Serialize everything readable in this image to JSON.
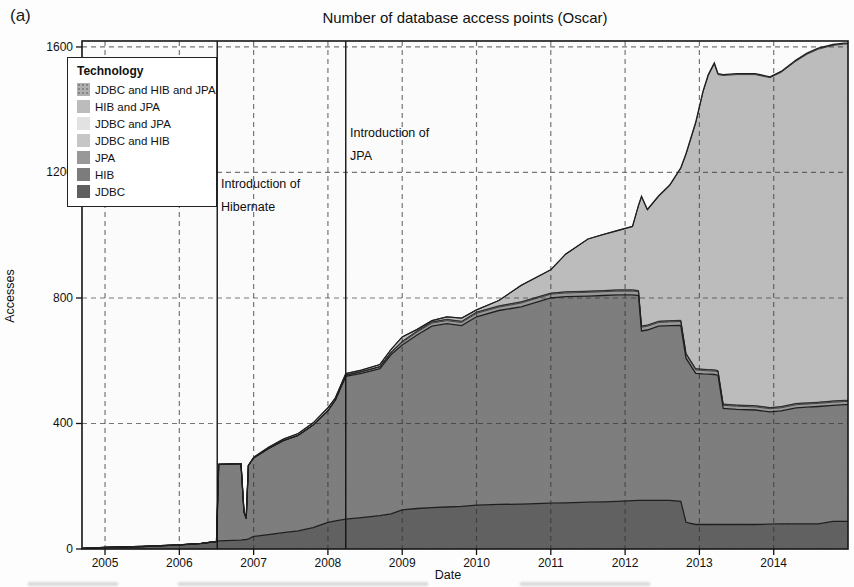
{
  "figure_label": "(a)",
  "title": "Number of database access points (Oscar)",
  "axes": {
    "x_label": "Date",
    "y_label": "Accesses"
  },
  "legend": {
    "title": "Technology",
    "entries": [
      {
        "label": "JDBC and HIB and JPA",
        "color": "#b0b0b0",
        "dotted": true
      },
      {
        "label": "HIB and JPA",
        "color": "#bcbcbc",
        "dotted": false
      },
      {
        "label": "JDBC and JPA",
        "color": "#e2e2e2",
        "dotted": false
      },
      {
        "label": "JDBC and HIB",
        "color": "#c6c6c6",
        "dotted": false
      },
      {
        "label": "JPA",
        "color": "#989898",
        "dotted": false
      },
      {
        "label": "HIB",
        "color": "#7c7c7c",
        "dotted": false
      },
      {
        "label": "JDBC",
        "color": "#5f5f5f",
        "dotted": false
      }
    ]
  },
  "annotations": [
    {
      "line1": "Introduction of",
      "line2": "Hibernate",
      "year": 2006.51
    },
    {
      "line1": "Introduction of",
      "line2": "JPA",
      "year": 2008.24
    }
  ],
  "chart_data": {
    "type": "area",
    "stacked": true,
    "title": "Number of database access points (Oscar)",
    "xlabel": "Date",
    "ylabel": "Accesses",
    "x_range": [
      2004.69,
      2015.0
    ],
    "y_range": [
      0,
      1619
    ],
    "x_ticks": [
      2005,
      2006,
      2007,
      2008,
      2009,
      2010,
      2011,
      2012,
      2013,
      2014
    ],
    "y_ticks": [
      0,
      400,
      800,
      1200,
      1600
    ],
    "grid": true,
    "legend_position": "top-left",
    "event_lines": [
      2006.51,
      2008.24
    ],
    "x": [
      2004.69,
      2005.0,
      2005.5,
      2006.0,
      2006.3,
      2006.5,
      2006.53,
      2006.83,
      2006.87,
      2006.9,
      2006.93,
      2007.0,
      2007.2,
      2007.4,
      2007.6,
      2007.8,
      2008.0,
      2008.1,
      2008.24,
      2008.45,
      2008.7,
      2008.85,
      2009.0,
      2009.2,
      2009.4,
      2009.6,
      2009.8,
      2010.0,
      2010.3,
      2010.6,
      2011.0,
      2011.2,
      2011.5,
      2011.7,
      2011.9,
      2012.1,
      2012.18,
      2012.22,
      2012.3,
      2012.45,
      2012.6,
      2012.75,
      2012.82,
      2012.95,
      2013.05,
      2013.12,
      2013.2,
      2013.25,
      2013.32,
      2013.5,
      2013.75,
      2013.95,
      2014.1,
      2014.3,
      2014.45,
      2014.6,
      2014.8,
      2014.95,
      2015.0
    ],
    "series": [
      {
        "name": "JDBC",
        "color": "#5f5f5f",
        "values": [
          2,
          5,
          8,
          13,
          18,
          24,
          26,
          28,
          30,
          30,
          32,
          40,
          46,
          52,
          58,
          68,
          85,
          90,
          95,
          100,
          106,
          112,
          125,
          129,
          132,
          134,
          136,
          140,
          142,
          143,
          146,
          147,
          149,
          150,
          152,
          154,
          155,
          155,
          155,
          155,
          155,
          152,
          85,
          78,
          78,
          78,
          78,
          78,
          78,
          78,
          78,
          79,
          80,
          80,
          80,
          80,
          88,
          88,
          88
        ]
      },
      {
        "name": "HIB",
        "color": "#7c7c7c",
        "values": [
          0,
          0,
          0,
          0,
          0,
          0,
          244,
          244,
          88,
          68,
          234,
          250,
          274,
          293,
          304,
          327,
          355,
          385,
          455,
          460,
          469,
          508,
          525,
          553,
          578,
          584,
          576,
          600,
          618,
          629,
          654,
          657,
          657,
          658,
          658,
          656,
          653,
          540,
          543,
          555,
          557,
          561,
          523,
          482,
          480,
          479,
          478,
          476,
          370,
          367,
          365,
          358,
          360,
          370,
          372,
          374,
          370,
          372,
          372
        ]
      },
      {
        "name": "JPA",
        "color": "#989898",
        "values": [
          0,
          0,
          0,
          0,
          0,
          0,
          0,
          0,
          0,
          0,
          0,
          0,
          0,
          0,
          0,
          0,
          0,
          0,
          4,
          5,
          6,
          7,
          8,
          9,
          10,
          10,
          10,
          11,
          11,
          12,
          12,
          12,
          12,
          12,
          12,
          12,
          12,
          12,
          12,
          12,
          12,
          12,
          12,
          11,
          11,
          11,
          11,
          11,
          10,
          10,
          10,
          10,
          10,
          10,
          10,
          10,
          10,
          10,
          10
        ]
      },
      {
        "name": "JDBC and HIB",
        "color": "#c6c6c6",
        "values": [
          0,
          0,
          0,
          0,
          0,
          0,
          0,
          0,
          0,
          0,
          0,
          0,
          0,
          0,
          0,
          0,
          0,
          0,
          0,
          0,
          0,
          0,
          3,
          3,
          3,
          3,
          3,
          3,
          3,
          3,
          3,
          3,
          3,
          3,
          3,
          3,
          3,
          3,
          3,
          3,
          3,
          3,
          3,
          3,
          3,
          3,
          3,
          3,
          3,
          3,
          3,
          3,
          3,
          3,
          3,
          3,
          3,
          3,
          3
        ]
      },
      {
        "name": "JDBC and JPA",
        "color": "#e2e2e2",
        "values": [
          0,
          0,
          0,
          0,
          0,
          0,
          0,
          0,
          0,
          0,
          0,
          0,
          0,
          0,
          0,
          0,
          0,
          0,
          0,
          0,
          0,
          0,
          1,
          1,
          1,
          1,
          1,
          1,
          1,
          1,
          1,
          1,
          1,
          1,
          1,
          1,
          1,
          1,
          1,
          1,
          1,
          1,
          1,
          1,
          1,
          1,
          1,
          1,
          1,
          1,
          1,
          1,
          1,
          1,
          1,
          1,
          1,
          1,
          1
        ]
      },
      {
        "name": "HIB and JPA",
        "color": "#bcbcbc",
        "values": [
          0,
          0,
          0,
          0,
          0,
          0,
          0,
          0,
          0,
          0,
          0,
          2,
          4,
          5,
          6,
          7,
          10,
          7,
          5,
          5,
          7,
          9,
          14,
          5,
          4,
          8,
          10,
          7,
          17,
          52,
          74,
          120,
          166,
          178,
          189,
          202,
          271,
          411,
          366,
          397,
          430,
          484,
          633,
          782,
          884,
          937,
          975,
          943,
          1047,
          1053,
          1055,
          1051,
          1065,
          1091,
          1111,
          1125,
          1133,
          1135,
          1135
        ]
      },
      {
        "name": "JDBC and HIB and JPA",
        "color": "#b0b0b0",
        "values": [
          0,
          0,
          0,
          0,
          0,
          0,
          0,
          0,
          0,
          0,
          0,
          0,
          0,
          0,
          0,
          0,
          0,
          0,
          0,
          0,
          0,
          0,
          0,
          0,
          0,
          0,
          0,
          0,
          0,
          0,
          0,
          0,
          0,
          0,
          0,
          0,
          0,
          2,
          2,
          2,
          2,
          2,
          3,
          3,
          3,
          3,
          3,
          3,
          3,
          3,
          3,
          3,
          3,
          3,
          3,
          3,
          3,
          3,
          3
        ]
      }
    ]
  }
}
